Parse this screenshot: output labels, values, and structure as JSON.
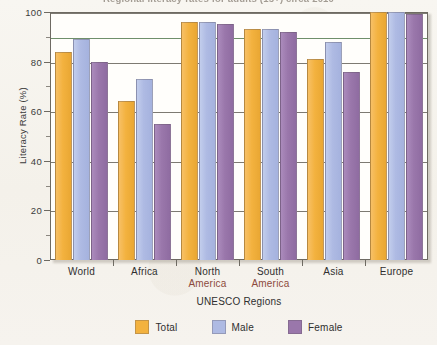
{
  "chart_data": {
    "type": "bar",
    "title": "Regional literacy rates for adults (15+) circa 2010",
    "xlabel": "UNESCO Regions",
    "ylabel": "Literacy Rate (%)",
    "ylim": [
      0,
      100
    ],
    "ytick_labels": [
      "0",
      "20",
      "40",
      "60",
      "80",
      "100"
    ],
    "ytick_values": [
      0,
      20,
      40,
      60,
      80,
      100
    ],
    "grid": true,
    "legend_position": "bottom",
    "categories": [
      "World",
      "Africa",
      "North America",
      "South America",
      "Asia",
      "Europe"
    ],
    "category_lines": [
      {
        "line1": "World",
        "line2": ""
      },
      {
        "line1": "Africa",
        "line2": ""
      },
      {
        "line1": "North",
        "line2": "America"
      },
      {
        "line1": "South",
        "line2": "America"
      },
      {
        "line1": "Asia",
        "line2": ""
      },
      {
        "line1": "Europe",
        "line2": ""
      }
    ],
    "series": [
      {
        "name": "Total",
        "color": "#f3b23f",
        "values": [
          84,
          64,
          96,
          93,
          81,
          100
        ]
      },
      {
        "name": "Male",
        "color": "#aebae3",
        "values": [
          89,
          73,
          96,
          93,
          88,
          100
        ]
      },
      {
        "name": "Female",
        "color": "#9a77ab",
        "values": [
          80,
          55,
          95,
          92,
          76,
          99
        ]
      }
    ]
  },
  "legend": {
    "items": [
      {
        "label": "Total"
      },
      {
        "label": "Male"
      },
      {
        "label": "Female"
      }
    ]
  },
  "colors": {
    "total": "#f3b23f",
    "male": "#aebae3",
    "female": "#9a77ab",
    "axis": "#6e6a62",
    "gridline": "#7d7a72",
    "gridline_accent": "#6f8f6a",
    "page_background": "#f6f4ef",
    "plot_background": "#fffefb",
    "accent_text": "#8d4a3c"
  }
}
